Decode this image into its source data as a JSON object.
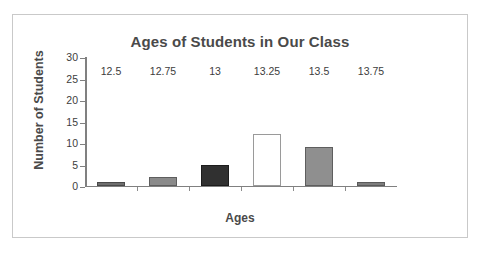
{
  "chart_data": {
    "type": "bar",
    "title": "Ages of Students in Our Class",
    "xlabel": "Ages",
    "ylabel": "Number of Students",
    "categories": [
      "12.5",
      "12.75",
      "13",
      "13.25",
      "13.5",
      "13.75"
    ],
    "values": [
      1,
      2,
      5,
      12,
      9,
      1
    ],
    "bar_colors": [
      "#6e6e6e",
      "#8a8a8a",
      "#303030",
      "#ffffff",
      "#8f8f8f",
      "#7d7d7d"
    ],
    "bar_edge_colors": [
      "#4a4a4a",
      "#5e5e5e",
      "#1c1c1c",
      "#9a9a9a",
      "#5e5e5e",
      "#5a5a5a"
    ],
    "ylim": [
      0,
      30
    ],
    "yticks": [
      0,
      5,
      10,
      15,
      20,
      25,
      30
    ],
    "ytick_labels": [
      "0",
      "5",
      "10",
      "15",
      "20",
      "25",
      "30"
    ],
    "grid": false,
    "legend": false
  },
  "style": {
    "axis_color": "#808080",
    "text_color": "#4a4a4a",
    "frame_color": "#c9c9c9",
    "background": "#ffffff"
  }
}
